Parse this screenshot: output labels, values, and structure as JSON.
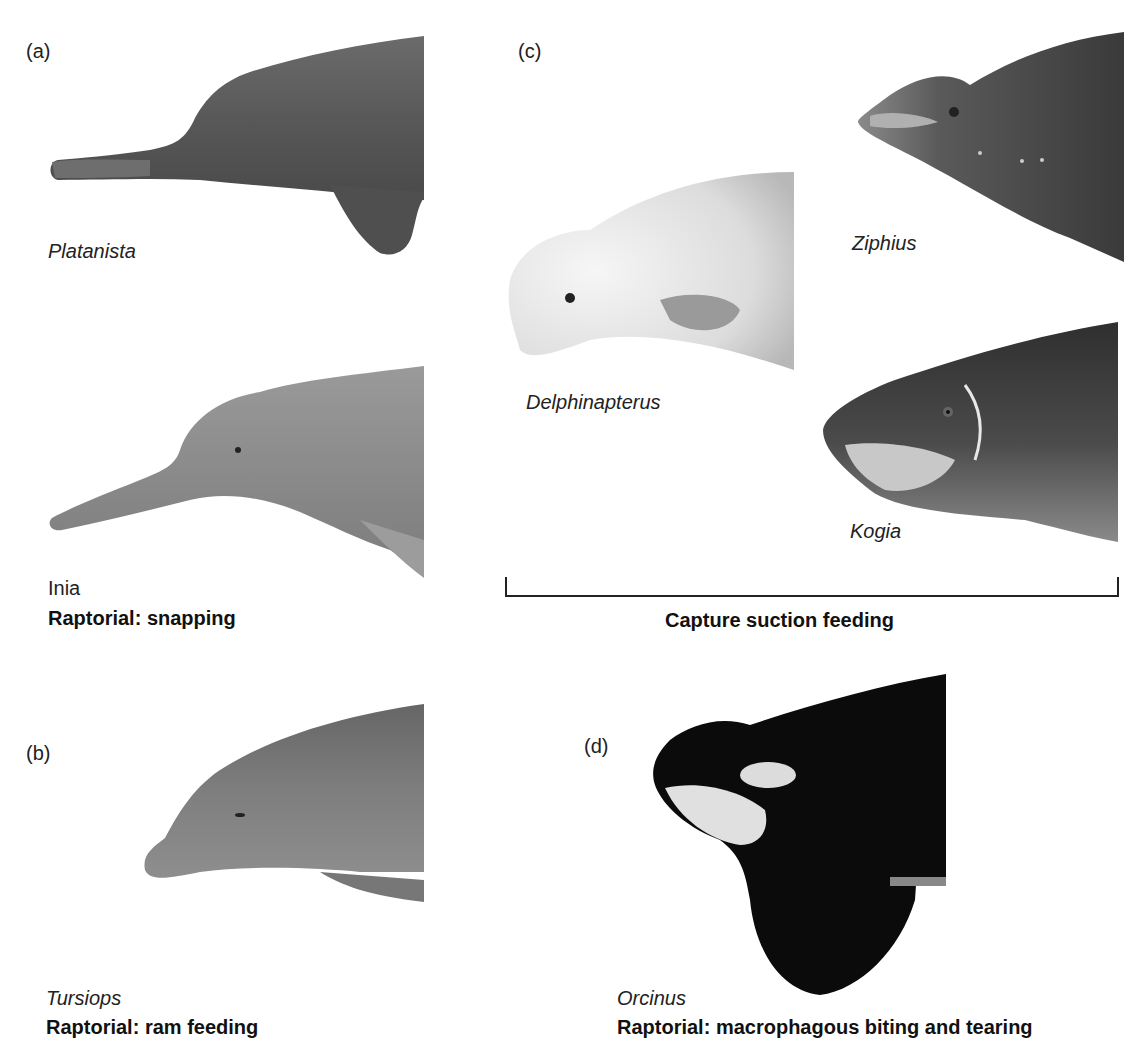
{
  "panels": {
    "a": {
      "label": "(a)",
      "species": [
        {
          "genus": "Platanista",
          "italic": true
        },
        {
          "genus": "Inia",
          "italic": false
        }
      ],
      "caption": "Raptorial: snapping"
    },
    "b": {
      "label": "(b)",
      "species": [
        {
          "genus": "Tursiops",
          "italic": true
        }
      ],
      "caption": "Raptorial: ram feeding"
    },
    "c": {
      "label": "(c)",
      "species": [
        {
          "genus": "Ziphius",
          "italic": true
        },
        {
          "genus": "Delphinapterus",
          "italic": true
        },
        {
          "genus": "Kogia",
          "italic": true
        }
      ],
      "caption": "Capture suction feeding"
    },
    "d": {
      "label": "(d)",
      "species": [
        {
          "genus": "Orcinus",
          "italic": true
        }
      ],
      "caption": "Raptorial: macrophagous biting and tearing"
    }
  },
  "colors": {
    "platanista": "#5e5e5e",
    "inia": "#8a8a8a",
    "tursiops": "#7d7d7d",
    "ziphius": "#5a5a5a",
    "delphinapterus": "#e6e6e6",
    "kogia": "#4a4a4a",
    "orcinus": "#0d0d0d"
  }
}
